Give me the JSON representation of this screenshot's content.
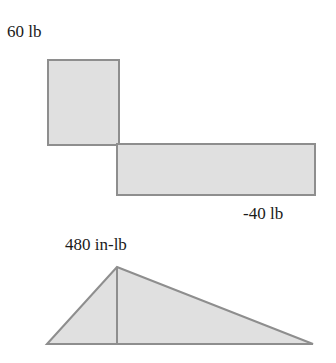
{
  "diagram": {
    "type": "shear-and-moment-diagram",
    "shear": {
      "positive_label": "60 lb",
      "negative_label": "-40 lb",
      "segments": [
        {
          "value": 60,
          "sign": "positive"
        },
        {
          "value": -40,
          "sign": "negative"
        }
      ]
    },
    "moment": {
      "max_label": "480 in-lb",
      "shape": "triangle",
      "peak_value": 480
    },
    "colors": {
      "fill": "#e0e0e0",
      "stroke": "#8e8e8e",
      "text": "#1a1a1a"
    }
  }
}
